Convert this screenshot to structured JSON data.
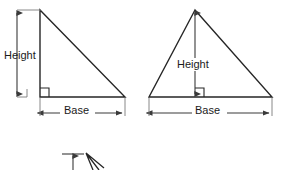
{
  "figure": {
    "stroke_color": "#262626",
    "dimension_color": "#3a3a3a",
    "background": "#ffffff"
  },
  "diagrams": [
    {
      "name": "right-triangle",
      "shape": "right triangle",
      "vertices": [
        [
          40,
          10
        ],
        [
          40,
          97
        ],
        [
          125,
          97
        ]
      ],
      "right_angle_at": [
        40,
        97
      ],
      "height_label": "Height",
      "base_label": "Base",
      "height_label_pos": [
        4,
        59
      ],
      "base_label_pos": [
        64,
        112
      ],
      "height_dim_line": {
        "x": 17,
        "y1": 10,
        "y2": 97
      },
      "base_dim_line": {
        "y": 113,
        "x1": 40,
        "x2": 125
      }
    },
    {
      "name": "acute-triangle",
      "shape": "acute triangle",
      "vertices": [
        [
          195,
          10
        ],
        [
          149,
          97
        ],
        [
          272,
          97
        ]
      ],
      "right_angle_at": [
        195,
        97
      ],
      "height_label": "Height",
      "base_label": "Base",
      "height_label_pos": [
        177,
        66
      ],
      "base_label_pos": [
        195,
        112
      ],
      "height_dim_line": {
        "x": 195,
        "y1": 10,
        "y2": 97
      },
      "base_dim_line": {
        "y": 113,
        "x1": 149,
        "x2": 272
      }
    }
  ],
  "partial_diagram": {
    "name": "cropped-third-diagram",
    "note": "partially visible diagram cut off at bottom edge",
    "tick_line": {
      "x1": 62,
      "x2": 84,
      "y": 154
    },
    "arrow": {
      "x": 73,
      "y1": 154,
      "y2": 166
    },
    "wedge_apex": [
      86,
      153
    ]
  }
}
